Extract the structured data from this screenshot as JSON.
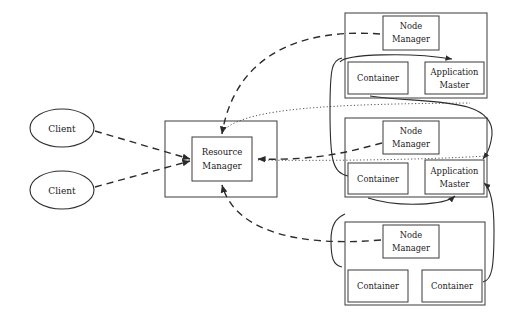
{
  "diagram": {
    "type": "architecture-diagram",
    "background_color": "#ffffff",
    "line_color": "#2b2b2b"
  },
  "clients": [
    {
      "id": "client-1",
      "label": "Client",
      "cx": 62,
      "cy": 128,
      "rx": 32,
      "ry": 19
    },
    {
      "id": "client-2",
      "label": "Client",
      "cx": 62,
      "cy": 190,
      "rx": 32,
      "ry": 19
    }
  ],
  "resource_manager": {
    "outer": {
      "x": 165,
      "y": 121,
      "w": 112,
      "h": 76
    },
    "inner": {
      "x": 192,
      "y": 137,
      "w": 60,
      "h": 44
    },
    "label_line_1": "Resource",
    "label_line_2": "Manager"
  },
  "nodes": [
    {
      "id": "node-1",
      "outer": {
        "x": 345,
        "y": 13,
        "w": 142,
        "h": 85
      },
      "node_manager": {
        "x": 383,
        "y": 16,
        "w": 56,
        "h": 34,
        "line_1": "Node",
        "line_2": "Manager"
      },
      "children": [
        {
          "id": "container",
          "label_line_1": "Container",
          "label_line_2": "",
          "x": 348,
          "y": 62,
          "w": 60,
          "h": 32
        },
        {
          "id": "application-master",
          "label_line_1": "Application",
          "label_line_2": "Master",
          "x": 425,
          "y": 62,
          "w": 59,
          "h": 32
        }
      ]
    },
    {
      "id": "node-2",
      "outer": {
        "x": 345,
        "y": 118,
        "w": 142,
        "h": 79
      },
      "node_manager": {
        "x": 383,
        "y": 121,
        "w": 56,
        "h": 33,
        "line_1": "Node",
        "line_2": "Manager"
      },
      "children": [
        {
          "id": "container",
          "label_line_1": "Container",
          "label_line_2": "",
          "x": 348,
          "y": 163,
          "w": 60,
          "h": 31
        },
        {
          "id": "application-master",
          "label_line_1": "Application",
          "label_line_2": "Master",
          "x": 425,
          "y": 160,
          "w": 59,
          "h": 34
        }
      ]
    },
    {
      "id": "node-3",
      "outer": {
        "x": 345,
        "y": 222,
        "w": 140,
        "h": 83
      },
      "node_manager": {
        "x": 383,
        "y": 225,
        "w": 56,
        "h": 33,
        "line_1": "Node",
        "line_2": "Manager"
      },
      "children": [
        {
          "id": "container-left",
          "label_line_1": "Container",
          "label_line_2": "",
          "x": 348,
          "y": 270,
          "w": 60,
          "h": 32
        },
        {
          "id": "container-right",
          "label_line_1": "Container",
          "label_line_2": "",
          "x": 422,
          "y": 270,
          "w": 60,
          "h": 32
        }
      ]
    }
  ],
  "edges": [
    {
      "id": "client1-to-rm",
      "style": "dashed",
      "arrow": true,
      "d": "M 95 131 L 190 159"
    },
    {
      "id": "client2-to-rm",
      "style": "dashed",
      "arrow": true,
      "d": "M 95 187 L 190 161"
    },
    {
      "id": "node1-nm-to-rm",
      "style": "dashed",
      "arrow": true,
      "d": "M 380 34 C 300 28 235 55 222 134"
    },
    {
      "id": "node2-to-rm",
      "style": "dashed",
      "arrow": true,
      "d": "M 382 143 C 355 150 320 161 258 159"
    },
    {
      "id": "node3-nm-to-rm",
      "style": "dashed",
      "arrow": true,
      "d": "M 381 240 C 300 247 235 232 222 185"
    },
    {
      "id": "node1-container-to-am",
      "style": "solid",
      "arrow": true,
      "d": "M 340 62 C 345 54 410 52 452 59"
    },
    {
      "id": "node1-am-to-node2-right",
      "style": "solid",
      "arrow": true,
      "d": "M 370 96 C 420 104 495 95 492 135 C 490 150 486 155 483 159"
    },
    {
      "id": "node2-left-wrap",
      "style": "solid",
      "arrow": false,
      "d": "M 342 58 C 332 60 330 68 330 110 C 330 160 332 172 348 176"
    },
    {
      "id": "node2-am-to-node3",
      "style": "solid",
      "arrow": true,
      "d": "M 368 198 C 400 208 445 205 455 196"
    },
    {
      "id": "node3-right-wrap",
      "style": "solid",
      "arrow": true,
      "d": "M 483 282 C 492 280 494 268 494 230 C 494 200 490 188 484 183"
    },
    {
      "id": "node3-left-wrap",
      "style": "solid",
      "arrow": false,
      "d": "M 342 267 C 333 265 331 258 331 240 C 331 225 336 218 345 214"
    },
    {
      "id": "node1-dotted-to-rm",
      "style": "dotted",
      "arrow": false,
      "d": "M 225 129 C 250 108 330 104 470 103"
    },
    {
      "id": "node2-dotted-to-rm",
      "style": "dotted",
      "arrow": false,
      "d": "M 258 160 C 320 161 420 160 487 156"
    }
  ]
}
